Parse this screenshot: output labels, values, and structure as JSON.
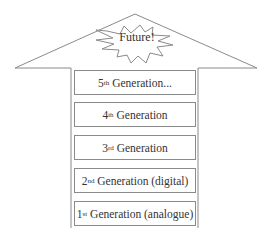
{
  "diagram": {
    "type": "upward-arrow-stack",
    "burst_label": "Future!",
    "generations": [
      {
        "ordinal": "5",
        "suffix": "th",
        "label": "Generation...",
        "order": 5
      },
      {
        "ordinal": "4",
        "suffix": "th",
        "label": "Generation",
        "order": 4
      },
      {
        "ordinal": "3",
        "suffix": "rd",
        "label": "Generation",
        "order": 3
      },
      {
        "ordinal": "2",
        "suffix": "nd",
        "label": "Generation (digital)",
        "order": 2
      },
      {
        "ordinal": "1",
        "suffix": "st",
        "label": "Generation (analogue)",
        "order": 1
      }
    ],
    "colors": {
      "line": "#8a8a8a",
      "text": "#333333",
      "background": "#ffffff"
    }
  }
}
